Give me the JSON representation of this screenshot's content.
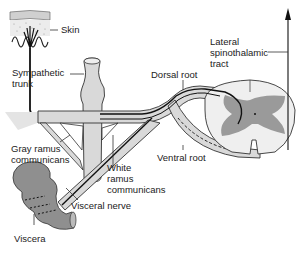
{
  "diagram": {
    "labels": {
      "skin": "Skin",
      "sympathetic_trunk": [
        "Sympathetic",
        "trunk"
      ],
      "lateral_spinothalamic_tract": [
        "Lateral",
        "spinothalamic",
        "tract"
      ],
      "dorsal_root": "Dorsal root",
      "gray_ramus_communicans": [
        "Gray ramus",
        "communicans"
      ],
      "white_ramus_communicans": [
        "White",
        "ramus",
        "communicans"
      ],
      "ventral_root": "Ventral root",
      "visceral_nerve": "Visceral nerve",
      "viscera": "Viscera"
    },
    "colors": {
      "tissue_light": "#d9d9d9",
      "tissue_mid": "#b5b5b5",
      "gray_matter": "#9a9a9a",
      "viscera": "#8f8f8f",
      "outline": "#222222",
      "nerve_fiber": "#111111"
    }
  }
}
